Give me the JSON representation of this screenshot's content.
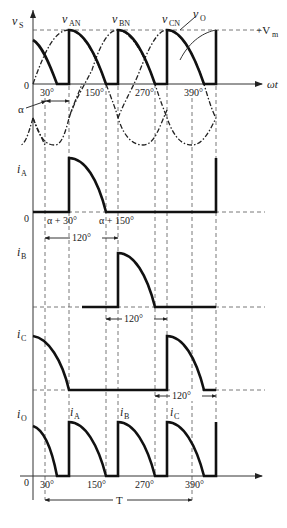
{
  "figure": {
    "panels": {
      "voltage": {
        "ylabel": "v",
        "ylabel_sub": "S",
        "curve_labels": [
          {
            "main": "v",
            "sub": "AN"
          },
          {
            "main": "v",
            "sub": "BN"
          },
          {
            "main": "v",
            "sub": "CN"
          },
          {
            "main": "v",
            "sub": "O"
          }
        ],
        "vm_label": "+V",
        "vm_sub": "m",
        "xlabel": "ωt",
        "origin": "0",
        "ticks": [
          "30°",
          "150°",
          "270°",
          "390°"
        ],
        "alpha_label": "α"
      },
      "iA": {
        "ylabel": "i",
        "ylabel_sub": "A",
        "origin": "0",
        "annotations": [
          "α + 30°",
          "α + 150°"
        ],
        "interval": "120°"
      },
      "iB": {
        "ylabel": "i",
        "ylabel_sub": "B",
        "interval": "120°"
      },
      "iC": {
        "ylabel": "i",
        "ylabel_sub": "C",
        "interval": "120°"
      },
      "iO": {
        "ylabel": "i",
        "ylabel_sub": "O",
        "pulse_labels": [
          {
            "main": "i",
            "sub": "A"
          },
          {
            "main": "i",
            "sub": "B"
          },
          {
            "main": "i",
            "sub": "C"
          }
        ],
        "origin": "0",
        "ticks": [
          "30°",
          "150°",
          "270°",
          "390°"
        ],
        "period_label": "T"
      }
    }
  }
}
